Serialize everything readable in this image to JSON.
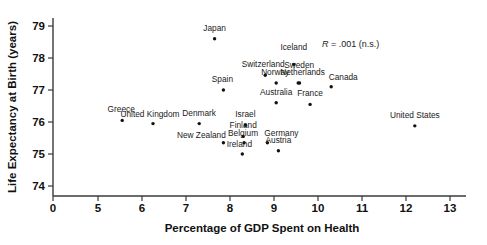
{
  "chart_data": {
    "type": "scatter",
    "title": "",
    "xlabel": "Percentage of GDP Spent on Health",
    "ylabel": "Life Expectancy at Birth (years)",
    "xlim": [
      4.7,
      13.3
    ],
    "ylim": [
      73.6,
      79.4
    ],
    "grid": false,
    "legend": "none",
    "xticks": [
      0,
      5,
      6,
      7,
      8,
      9,
      10,
      11,
      12,
      13
    ],
    "xtick_labels": [
      "0",
      "5",
      "6",
      "7",
      "8",
      "9",
      "10",
      "11",
      "12",
      "13"
    ],
    "x_axis_broken": true,
    "yticks": [
      74,
      75,
      76,
      77,
      78,
      79
    ],
    "ytick_labels": [
      "74",
      "75",
      "76",
      "77",
      "78",
      "79"
    ],
    "annotations": [
      {
        "text": "R = .001 (n.s.)",
        "stat_symbol": "R",
        "stat_value": ".001",
        "significance": "(n.s.)"
      }
    ],
    "points": [
      {
        "label": "Japan",
        "x": 7.65,
        "y": 78.6
      },
      {
        "label": "Switzerland",
        "x": 8.8,
        "y": 77.46
      },
      {
        "label": "Iceland",
        "x": 9.45,
        "y": 77.8
      },
      {
        "label": "Norway",
        "x": 9.05,
        "y": 77.22
      },
      {
        "label": "Sweden",
        "x": 9.55,
        "y": 77.22
      },
      {
        "label": "Netherlands",
        "x": 9.58,
        "y": 77.22
      },
      {
        "label": "Canada",
        "x": 10.3,
        "y": 77.1
      },
      {
        "label": "Spain",
        "x": 7.85,
        "y": 77.0
      },
      {
        "label": "Australia",
        "x": 9.05,
        "y": 76.6
      },
      {
        "label": "France",
        "x": 9.82,
        "y": 76.55
      },
      {
        "label": "Greece",
        "x": 5.55,
        "y": 76.05
      },
      {
        "label": "United Kingdom",
        "x": 6.25,
        "y": 75.95
      },
      {
        "label": "Denmark",
        "x": 7.3,
        "y": 75.95
      },
      {
        "label": "Israel",
        "x": 8.35,
        "y": 75.9
      },
      {
        "label": "United States",
        "x": 12.2,
        "y": 75.88
      },
      {
        "label": "Finland",
        "x": 8.3,
        "y": 75.55
      },
      {
        "label": "New Zealand",
        "x": 7.85,
        "y": 75.35
      },
      {
        "label": "Belgium",
        "x": 8.32,
        "y": 75.35
      },
      {
        "label": "Germany",
        "x": 8.85,
        "y": 75.35
      },
      {
        "label": "Austria",
        "x": 9.1,
        "y": 75.1
      },
      {
        "label": "Ireland",
        "x": 8.28,
        "y": 75.0
      }
    ]
  }
}
